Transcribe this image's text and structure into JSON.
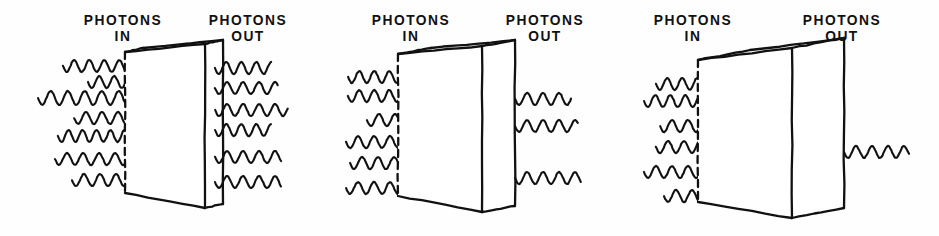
{
  "figure": {
    "background_color": "#ffffff",
    "ink_color": "#111111",
    "width": 939,
    "height": 236
  },
  "labels": {
    "in_line1": "PHOTONS",
    "in_line2": "IN",
    "out_line1": "PHOTONS",
    "out_line2": "OUT"
  },
  "panels": [
    {
      "id": "panel-thin",
      "name": "thin-absorber",
      "x": 0,
      "thickness_label": "thin",
      "photons_in": 7,
      "photons_out": 6,
      "in_label_x": 123,
      "out_label_x": 248,
      "slab": {
        "front_top_x": 125,
        "front_top_y": 52,
        "front_bottom_x": 125,
        "front_bottom_y": 193,
        "back_top_x": 205,
        "back_top_y": 44,
        "back_bottom_x": 205,
        "back_bottom_y": 208,
        "depth_x": 18,
        "depth_y": -4
      },
      "in_waves": [
        {
          "y": 66,
          "x_start": 63,
          "x_end": 153,
          "wavelength": 15,
          "amp": 6
        },
        {
          "y": 82,
          "x_start": 88,
          "x_end": 166,
          "wavelength": 15,
          "amp": 6
        },
        {
          "y": 98,
          "x_start": 38,
          "x_end": 181,
          "wavelength": 17,
          "amp": 7
        },
        {
          "y": 118,
          "x_start": 74,
          "x_end": 163,
          "wavelength": 16,
          "amp": 6
        },
        {
          "y": 136,
          "x_start": 58,
          "x_end": 178,
          "wavelength": 14,
          "amp": 6
        },
        {
          "y": 159,
          "x_start": 55,
          "x_end": 152,
          "wavelength": 16,
          "amp": 6
        },
        {
          "y": 180,
          "x_start": 72,
          "x_end": 178,
          "wavelength": 16,
          "amp": 6
        }
      ],
      "out_waves": [
        {
          "y": 68,
          "x_start": 215,
          "x_end": 272,
          "wavelength": 15,
          "amp": 6
        },
        {
          "y": 88,
          "x_start": 215,
          "x_end": 278,
          "wavelength": 16,
          "amp": 6
        },
        {
          "y": 110,
          "x_start": 215,
          "x_end": 288,
          "wavelength": 16,
          "amp": 6
        },
        {
          "y": 130,
          "x_start": 215,
          "x_end": 272,
          "wavelength": 15,
          "amp": 6
        },
        {
          "y": 157,
          "x_start": 215,
          "x_end": 282,
          "wavelength": 16,
          "amp": 6
        },
        {
          "y": 182,
          "x_start": 215,
          "x_end": 282,
          "wavelength": 16,
          "amp": 6
        }
      ]
    },
    {
      "id": "panel-medium",
      "name": "medium-absorber",
      "x": 310,
      "thickness_label": "medium",
      "photons_in": 6,
      "photons_out": 3,
      "in_label_x": 101,
      "out_label_x": 235,
      "slab": {
        "front_top_x": 88,
        "front_top_y": 54,
        "front_bottom_x": 88,
        "front_bottom_y": 196,
        "back_top_x": 172,
        "back_top_y": 46,
        "back_bottom_x": 172,
        "back_bottom_y": 212,
        "depth_x": 33,
        "depth_y": -6
      },
      "in_waves": [
        {
          "y": 77,
          "x_start": 38,
          "x_end": 140,
          "wavelength": 15,
          "amp": 6
        },
        {
          "y": 96,
          "x_start": 38,
          "x_end": 126,
          "wavelength": 15,
          "amp": 6
        },
        {
          "y": 120,
          "x_start": 57,
          "x_end": 147,
          "wavelength": 16,
          "amp": 6
        },
        {
          "y": 142,
          "x_start": 36,
          "x_end": 128,
          "wavelength": 16,
          "amp": 6
        },
        {
          "y": 163,
          "x_start": 40,
          "x_end": 145,
          "wavelength": 16,
          "amp": 6
        },
        {
          "y": 188,
          "x_start": 36,
          "x_end": 140,
          "wavelength": 16,
          "amp": 6
        }
      ],
      "out_waves": [
        {
          "y": 99,
          "x_start": 205,
          "x_end": 262,
          "wavelength": 16,
          "amp": 6
        },
        {
          "y": 126,
          "x_start": 205,
          "x_end": 268,
          "wavelength": 16,
          "amp": 6
        },
        {
          "y": 178,
          "x_start": 205,
          "x_end": 272,
          "wavelength": 16,
          "amp": 6
        }
      ]
    },
    {
      "id": "panel-thick",
      "name": "thick-absorber",
      "x": 620,
      "thickness_label": "thick",
      "photons_in": 6,
      "photons_out": 1,
      "in_label_x": 73,
      "out_label_x": 222,
      "slab": {
        "front_top_x": 78,
        "front_top_y": 60,
        "front_bottom_x": 78,
        "front_bottom_y": 202,
        "back_top_x": 172,
        "back_top_y": 48,
        "back_bottom_x": 172,
        "back_bottom_y": 218,
        "depth_x": 52,
        "depth_y": -10
      },
      "in_waves": [
        {
          "y": 84,
          "x_start": 36,
          "x_end": 126,
          "wavelength": 15,
          "amp": 6
        },
        {
          "y": 101,
          "x_start": 24,
          "x_end": 114,
          "wavelength": 15,
          "amp": 6
        },
        {
          "y": 126,
          "x_start": 40,
          "x_end": 145,
          "wavelength": 16,
          "amp": 6
        },
        {
          "y": 147,
          "x_start": 36,
          "x_end": 136,
          "wavelength": 16,
          "amp": 6
        },
        {
          "y": 172,
          "x_start": 24,
          "x_end": 142,
          "wavelength": 16,
          "amp": 6
        },
        {
          "y": 196,
          "x_start": 44,
          "x_end": 122,
          "wavelength": 16,
          "amp": 6
        }
      ],
      "out_waves": [
        {
          "y": 152,
          "x_start": 224,
          "x_end": 290,
          "wavelength": 16,
          "amp": 6
        }
      ]
    }
  ]
}
